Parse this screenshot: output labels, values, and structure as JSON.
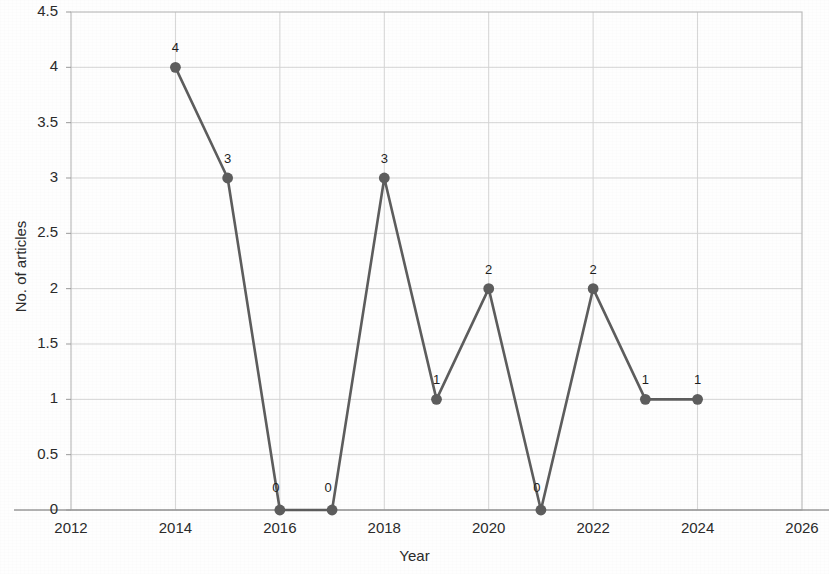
{
  "chart_data": {
    "type": "line",
    "title": "",
    "xlabel": "Year",
    "ylabel": "No. of articles",
    "x": [
      2014,
      2015,
      2016,
      2017,
      2018,
      2019,
      2020,
      2021,
      2022,
      2023,
      2024
    ],
    "values": [
      4,
      3,
      0,
      0,
      3,
      1,
      2,
      0,
      2,
      1,
      1
    ],
    "point_labels": [
      "4",
      "3",
      "0",
      "0",
      "3",
      "1",
      "2",
      "0",
      "2",
      "1",
      "1"
    ],
    "xlim": [
      2012,
      2026
    ],
    "ylim": [
      0,
      4.5
    ],
    "x_ticks": [
      2012,
      2014,
      2016,
      2018,
      2020,
      2022,
      2024,
      2026
    ],
    "x_tick_labels": [
      "2012",
      "2014",
      "2016",
      "2018",
      "2020",
      "2022",
      "2024",
      "2026"
    ],
    "y_ticks": [
      0,
      0.5,
      1,
      1.5,
      2,
      2.5,
      3,
      3.5,
      4,
      4.5
    ],
    "y_tick_labels": [
      "0",
      "0.5",
      "1",
      "1.5",
      "2",
      "2.5",
      "3",
      "3.5",
      "4",
      "4.5"
    ],
    "grid": true,
    "grid_x": true,
    "grid_y": true,
    "legend": false,
    "series_color": "#5d5d5d",
    "marker": "circle",
    "marker_color": "#5d5d5d",
    "grid_color": "#d5d5d5",
    "border_color": "#bdbdbd",
    "background_color": "#fefefe",
    "data_labels_shown": true
  }
}
